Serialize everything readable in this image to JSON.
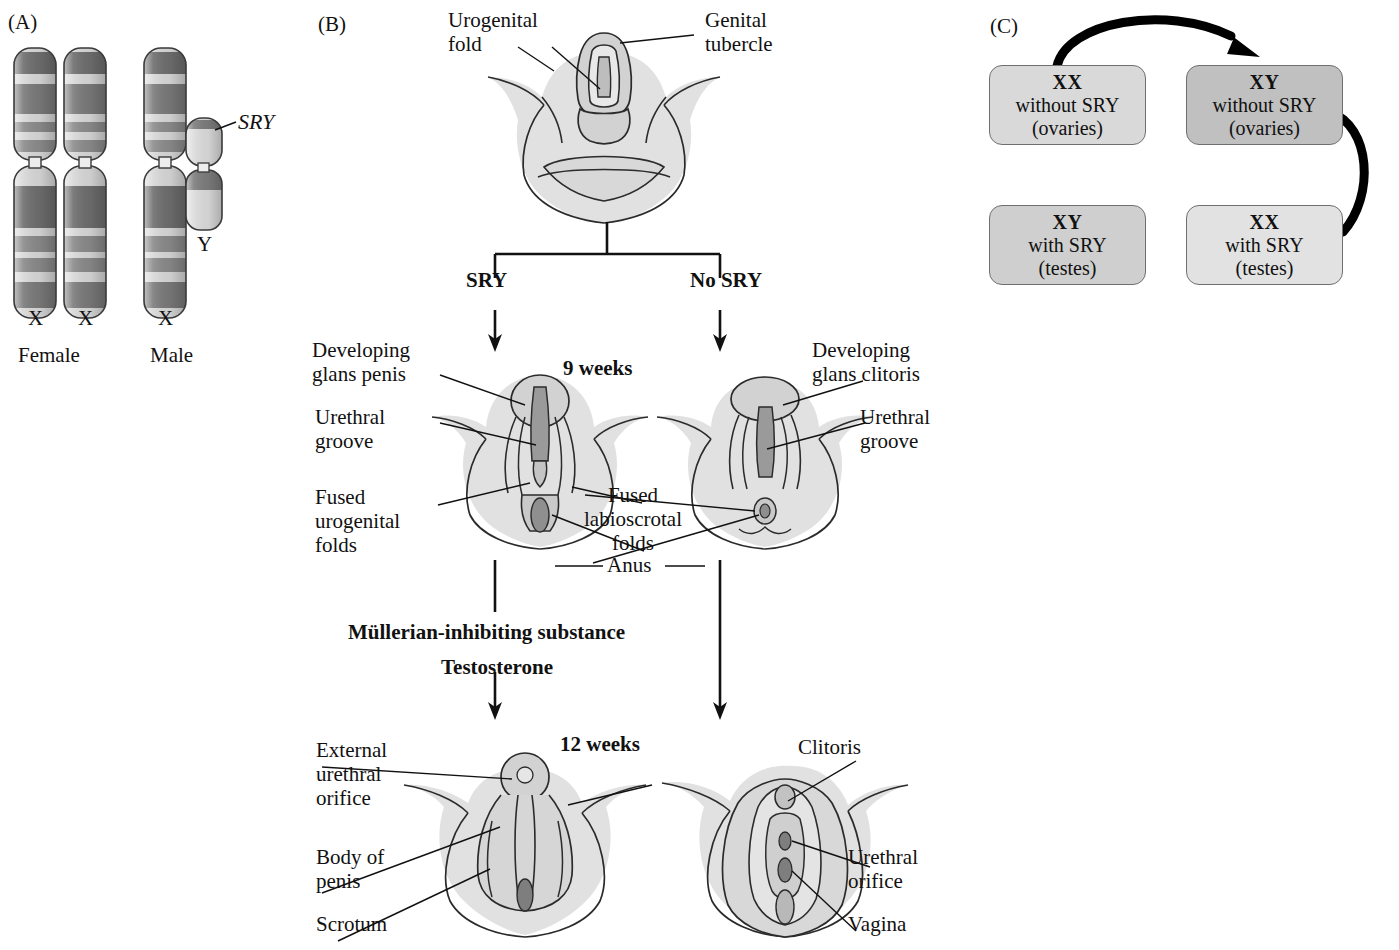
{
  "figure": {
    "panels": [
      {
        "tag": "(A)",
        "name": "sex-chromosomes"
      },
      {
        "tag": "(B)",
        "name": "external-genitalia-development"
      },
      {
        "tag": "(C)",
        "name": "sry-genotype-outcomes"
      }
    ]
  },
  "panelA": {
    "tag": "(A)",
    "gene_label": "SRY",
    "y_label": "Y",
    "chromosome_labels": [
      "X",
      "X",
      "X"
    ],
    "group_labels": [
      "Female",
      "Male"
    ],
    "bands": {
      "dark": "#6e6e6e",
      "mid": "#8c8c8c",
      "light": "#d8d8d8",
      "outline": "#3a3a3a"
    }
  },
  "panelB": {
    "tag": "(B)",
    "indifferent_stage": {
      "labels": [
        {
          "text": "Urogenital\nfold",
          "name": "urogenital-fold"
        },
        {
          "text": "Genital\ntubercle",
          "name": "genital-tubercle"
        }
      ]
    },
    "branches": {
      "left": "SRY",
      "right": "No SRY"
    },
    "stage_9_weeks": "9 weeks",
    "stage_12_weeks": "12 weeks",
    "hormones": [
      "Müllerian-inhibiting substance",
      "Testosterone"
    ],
    "male_9w_labels": [
      {
        "text": "Developing\nglans penis",
        "name": "developing-glans-penis"
      },
      {
        "text": "Urethral\ngroove",
        "name": "urethral-groove-male"
      },
      {
        "text": "Fused\nurogenital\nfolds",
        "name": "fused-urogenital-folds"
      }
    ],
    "female_9w_labels": [
      {
        "text": "Developing\nglans clitoris",
        "name": "developing-glans-clitoris"
      },
      {
        "text": "Urethral\ngroove",
        "name": "urethral-groove-female"
      }
    ],
    "shared_9w_labels": [
      {
        "text": "Fused\nlabioscrotal\nfolds",
        "name": "fused-labioscrotal-folds"
      },
      {
        "text": "Anus",
        "name": "anus"
      }
    ],
    "male_12w_labels": [
      {
        "text": "External\nurethral\norifice",
        "name": "external-urethral-orifice"
      },
      {
        "text": "Body of\npenis",
        "name": "body-of-penis"
      },
      {
        "text": "Scrotum",
        "name": "scrotum"
      }
    ],
    "female_12w_labels": [
      {
        "text": "Clitoris",
        "name": "clitoris"
      },
      {
        "text": "Urethral\norifice",
        "name": "urethral-orifice-female"
      },
      {
        "text": "Vagina",
        "name": "vagina"
      }
    ],
    "tissue": {
      "fill": "#dedede",
      "outline": "#2b2b2b",
      "deep": "#9a9a9a"
    }
  },
  "panelC": {
    "tag": "(C)",
    "boxes": [
      {
        "genotype": "XX",
        "sry": "without SRY",
        "gonad": "(ovaries)",
        "shade": "#d9d9d9",
        "name": "box-xx-without-sry"
      },
      {
        "genotype": "XY",
        "sry": "without SRY",
        "gonad": "(ovaries)",
        "shade": "#c0c0c0",
        "name": "box-xy-without-sry"
      },
      {
        "genotype": "XY",
        "sry": "with SRY",
        "gonad": "(testes)",
        "shade": "#cfcfcf",
        "name": "box-xy-with-sry"
      },
      {
        "genotype": "XX",
        "sry": "with SRY",
        "gonad": "(testes)",
        "shade": "#e2e2e2",
        "name": "box-xx-with-sry"
      }
    ],
    "arrows": [
      {
        "name": "arrow-top-xx-to-xy",
        "from": "box-xx-without-sry",
        "to": "box-xy-without-sry"
      },
      {
        "name": "arrow-right-xy-to-xx",
        "from": "box-xy-without-sry",
        "to": "box-xx-with-sry"
      }
    ]
  }
}
